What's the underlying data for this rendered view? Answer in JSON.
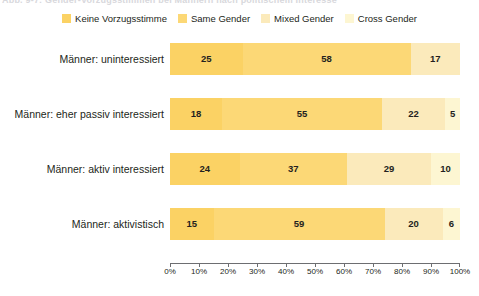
{
  "caption": {
    "text": "Abb. 9-7: Gender-Vorzugsstimmen bei Männern nach politischem Interesse"
  },
  "chart_data": {
    "type": "bar",
    "orientation": "horizontal",
    "stacked": true,
    "stack_unit": "percent",
    "title": "",
    "subtitle": "",
    "xlabel": "",
    "ylabel": "",
    "xlim": [
      0,
      100
    ],
    "grid": false,
    "legend_position": "top-center",
    "categories": [
      "Männer: uninteressiert",
      "Männer: eher passiv interessiert",
      "Männer: aktiv interessiert",
      "Männer: aktivistisch"
    ],
    "series": [
      {
        "name": "Keine Vorzugsstimme",
        "color": "#fbd264",
        "values": [
          25,
          18,
          24,
          15
        ]
      },
      {
        "name": "Same Gender",
        "color": "#fcd876",
        "values": [
          58,
          55,
          37,
          59
        ]
      },
      {
        "name": "Mixed Gender",
        "color": "#fbeabb",
        "values": [
          17,
          22,
          29,
          20
        ]
      },
      {
        "name": "Cross Gender",
        "color": "#fdf6d2",
        "values": [
          0,
          5,
          10,
          6
        ]
      }
    ],
    "x_tick_labels": [
      "0%",
      "10%",
      "20%",
      "30%",
      "40%",
      "50%",
      "60%",
      "70%",
      "80%",
      "90%",
      "100%"
    ],
    "x_tick_values": [
      0,
      10,
      20,
      30,
      40,
      50,
      60,
      70,
      80,
      90,
      100
    ],
    "rows": [
      {
        "label": "Männer: uninteressiert",
        "segments": [
          {
            "series": "Keine Vorzugsstimme",
            "value": 25,
            "label": "25"
          },
          {
            "series": "Same Gender",
            "value": 58,
            "label": "58"
          },
          {
            "series": "Mixed Gender",
            "value": 17,
            "label": "17"
          },
          {
            "series": "Cross Gender",
            "value": 0,
            "label": ""
          }
        ]
      },
      {
        "label": "Männer: eher passiv interessiert",
        "segments": [
          {
            "series": "Keine Vorzugsstimme",
            "value": 18,
            "label": "18"
          },
          {
            "series": "Same Gender",
            "value": 55,
            "label": "55"
          },
          {
            "series": "Mixed Gender",
            "value": 22,
            "label": "22"
          },
          {
            "series": "Cross Gender",
            "value": 5,
            "label": "5"
          }
        ]
      },
      {
        "label": "Männer: aktiv interessiert",
        "segments": [
          {
            "series": "Keine Vorzugsstimme",
            "value": 24,
            "label": "24"
          },
          {
            "series": "Same Gender",
            "value": 37,
            "label": "37"
          },
          {
            "series": "Mixed Gender",
            "value": 29,
            "label": "29"
          },
          {
            "series": "Cross Gender",
            "value": 10,
            "label": "10"
          }
        ]
      },
      {
        "label": "Männer: aktivistisch",
        "segments": [
          {
            "series": "Keine Vorzugsstimme",
            "value": 15,
            "label": "15"
          },
          {
            "series": "Same Gender",
            "value": 59,
            "label": "59"
          },
          {
            "series": "Mixed Gender",
            "value": 20,
            "label": "20"
          },
          {
            "series": "Cross Gender",
            "value": 6,
            "label": "6"
          }
        ]
      }
    ]
  },
  "colors": {
    "keine_vorzugsstimme": "#fbd264",
    "same_gender": "#fcd876",
    "mixed_gender": "#fbeabb",
    "cross_gender": "#fdf6d2",
    "axis": "#6d6e71",
    "text": "#231f20",
    "background": "#ffffff"
  }
}
